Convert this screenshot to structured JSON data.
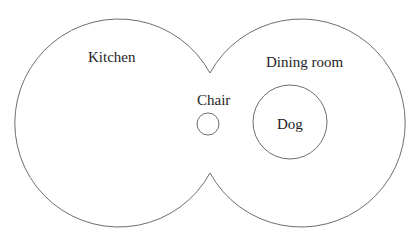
{
  "diagram": {
    "type": "euler-diagram",
    "regions": [
      {
        "id": "kitchen",
        "label": "Kitchen",
        "shape": "circle",
        "cx": 118,
        "cy": 123,
        "r": 104
      },
      {
        "id": "dining-room",
        "label": "Dining room",
        "shape": "circle",
        "cx": 301,
        "cy": 123,
        "r": 104
      }
    ],
    "objects": [
      {
        "id": "chair",
        "label": "Chair",
        "shape": "circle",
        "cx": 208,
        "cy": 124,
        "r": 11,
        "region": "boundary"
      },
      {
        "id": "dog",
        "label": "Dog",
        "shape": "circle",
        "cx": 290,
        "cy": 122,
        "r": 37,
        "region": "dining-room"
      }
    ],
    "labels": {
      "kitchen": "Kitchen",
      "dining_room": "Dining room",
      "chair": "Chair",
      "dog": "Dog"
    },
    "colors": {
      "stroke": "#6e6e6e",
      "text": "#1e1e1e",
      "background": "#ffffff"
    }
  }
}
